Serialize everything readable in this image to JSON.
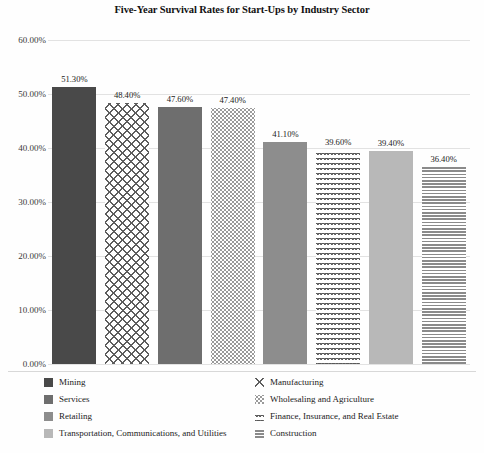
{
  "chart_data": {
    "type": "bar",
    "title": "Five-Year Survival Rates for Start-Ups by Industry Sector",
    "xlabel": "",
    "ylabel": "",
    "ylim": [
      0,
      60
    ],
    "ytick_labels": [
      "60.00%",
      "50.00%",
      "40.00%",
      "30.00%",
      "20.00%",
      "10.00%",
      "0.00%"
    ],
    "ytick_values": [
      60,
      50,
      40,
      30,
      20,
      10,
      0
    ],
    "grid": true,
    "legend_position": "bottom",
    "categories": [
      "Mining",
      "Manufacturing",
      "Services",
      "Wholesaling and Agriculture",
      "Retailing",
      "Finance, Insurance, and Real Estate",
      "Transportation, Communications, and Utilities",
      "Construction"
    ],
    "values": [
      51.3,
      48.4,
      47.6,
      47.4,
      41.1,
      39.6,
      39.4,
      36.4
    ],
    "data_labels": [
      "51.30%",
      "48.40%",
      "47.60%",
      "47.40%",
      "41.10%",
      "39.60%",
      "39.40%",
      "36.40%"
    ],
    "bars": [
      {
        "label": "Mining",
        "value": 51.3,
        "data_label": "51.30%",
        "fill_class": "fill-mining",
        "color": "#494949",
        "pattern": "solid"
      },
      {
        "label": "Manufacturing",
        "value": 48.4,
        "data_label": "48.40%",
        "fill_class": "fill-manufacturing",
        "color": "#5d5d5d",
        "pattern": "diagonal-crosshatch"
      },
      {
        "label": "Services",
        "value": 47.6,
        "data_label": "47.60%",
        "fill_class": "fill-services",
        "color": "#6e6e6e",
        "pattern": "solid"
      },
      {
        "label": "Wholesaling and Agriculture",
        "value": 47.4,
        "data_label": "47.40%",
        "fill_class": "fill-wholesaling",
        "color": "#9a9a9a",
        "pattern": "dots"
      },
      {
        "label": "Retailing",
        "value": 41.1,
        "data_label": "41.10%",
        "fill_class": "fill-retailing",
        "color": "#8d8d8d",
        "pattern": "solid"
      },
      {
        "label": "Finance, Insurance, and Real Estate",
        "value": 39.6,
        "data_label": "39.60%",
        "fill_class": "fill-finance",
        "color": "#585858",
        "pattern": "wavy-scales"
      },
      {
        "label": "Transportation, Communications, and Utilities",
        "value": 39.4,
        "data_label": "39.40%",
        "fill_class": "fill-transport",
        "color": "#b8b8b8",
        "pattern": "solid"
      },
      {
        "label": "Construction",
        "value": 36.4,
        "data_label": "36.40%",
        "fill_class": "fill-construction",
        "color": "#8a8a8a",
        "pattern": "vertical-dotted"
      }
    ],
    "legend": {
      "left_column": [
        {
          "label": "Mining",
          "fill_class": "fill-mining"
        },
        {
          "label": "Services",
          "fill_class": "fill-services"
        },
        {
          "label": "Retailing",
          "fill_class": "fill-retailing"
        },
        {
          "label": "Transportation, Communications, and Utilities",
          "fill_class": "fill-transport"
        }
      ],
      "right_column": [
        {
          "label": "Manufacturing",
          "fill_class": "fill-manufacturing"
        },
        {
          "label": "Wholesaling and Agriculture",
          "fill_class": "fill-wholesaling"
        },
        {
          "label": "Finance, Insurance, and Real Estate",
          "fill_class": "fill-finance"
        },
        {
          "label": "Construction",
          "fill_class": "fill-construction"
        }
      ]
    }
  }
}
